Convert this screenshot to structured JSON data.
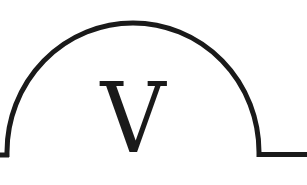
{
  "diagram": {
    "type": "meter-symbol",
    "symbol_letter": "V",
    "stroke_color": "#1a1a1a",
    "background_color": "#ffffff"
  }
}
